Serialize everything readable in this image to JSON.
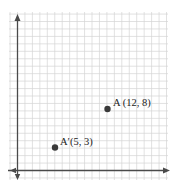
{
  "chart_data": {
    "type": "scatter",
    "title": "",
    "xlabel": "",
    "ylabel": "",
    "grid": true,
    "xlim": [
      -1,
      20
    ],
    "ylim": [
      -1,
      21
    ],
    "points": [
      {
        "name": "A",
        "label": "A (12, 8)",
        "x": 12,
        "y": 8
      },
      {
        "name": "A'",
        "label": "A′(5, 3)",
        "x": 5,
        "y": 3
      }
    ]
  },
  "colors": {
    "grid": "#d4d4d4",
    "axis": "#4a4a4a",
    "point": "#3a3a3a"
  }
}
